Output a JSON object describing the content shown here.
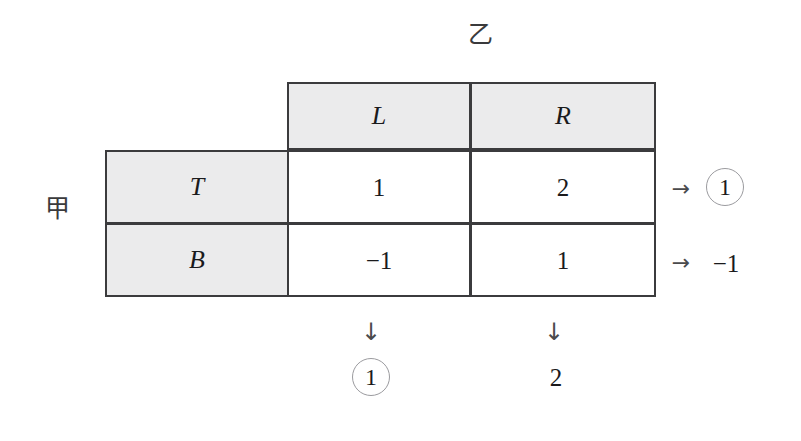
{
  "players": {
    "column_player_label": "乙",
    "row_player_label": "甲"
  },
  "icons": {
    "right_arrow": "→",
    "down_arrow": "↓"
  },
  "matrix": {
    "column_headers": [
      "L",
      "R"
    ],
    "row_headers": [
      "T",
      "B"
    ],
    "payoffs": [
      [
        "1",
        "2"
      ],
      [
        "−1",
        "1"
      ]
    ]
  },
  "row_best_responses": [
    {
      "arrow": "→",
      "value": "1",
      "circled": true
    },
    {
      "arrow": "→",
      "value": "−1",
      "circled": false
    }
  ],
  "column_best_responses": [
    {
      "arrow": "↓",
      "value": "1",
      "circled": true
    },
    {
      "arrow": "↓",
      "value": "2",
      "circled": false
    }
  ],
  "colors": {
    "border": "#3b3b3d",
    "header_fill": "#ebebec",
    "cell_fill": "#ffffff",
    "text": "#1a1a1c",
    "circle_stroke": "#9b9b9f"
  },
  "chart_data": {
    "type": "table",
    "title": "",
    "row_player": "甲",
    "column_player": "乙",
    "row_strategies": [
      "T",
      "B"
    ],
    "column_strategies": [
      "L",
      "R"
    ],
    "values": [
      [
        1,
        2
      ],
      [
        -1,
        1
      ]
    ],
    "row_maxima_marked": [
      1,
      -1
    ],
    "row_maxima_circled": [
      true,
      false
    ],
    "column_maxima_marked": [
      1,
      2
    ],
    "column_maxima_circled": [
      true,
      false
    ],
    "grid": true,
    "legend": "none"
  }
}
